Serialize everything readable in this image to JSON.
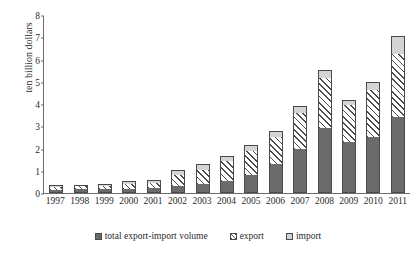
{
  "chart_data": {
    "type": "bar",
    "title": "",
    "subtitle": "",
    "xlabel": "",
    "ylabel": "ten billion dollars",
    "ylim": [
      0,
      8
    ],
    "ytick_values": [
      0,
      1,
      2,
      3,
      4,
      5,
      6,
      7,
      8
    ],
    "ytick_labels": [
      "0",
      "1",
      "2",
      "3",
      "4",
      "5",
      "6",
      "7",
      "8"
    ],
    "grid": false,
    "stacked": true,
    "legend_position": "bottom",
    "categories": [
      "1997",
      "1998",
      "1999",
      "2000",
      "2001",
      "2002",
      "2003",
      "2004",
      "2005",
      "2006",
      "2007",
      "2008",
      "2009",
      "2010",
      "2011"
    ],
    "series": [
      {
        "name": "total export-import volume",
        "color": "#6b6b6b",
        "pattern": "solid",
        "values": [
          0.15,
          0.16,
          0.17,
          0.2,
          0.22,
          0.3,
          0.4,
          0.55,
          0.8,
          1.3,
          2.0,
          2.9,
          2.3,
          2.5,
          3.4
        ]
      },
      {
        "name": "export",
        "color": "#ffffff",
        "pattern": "diagonal-hatch",
        "values": [
          0.13,
          0.14,
          0.15,
          0.22,
          0.24,
          0.5,
          0.65,
          0.9,
          1.1,
          1.2,
          1.6,
          2.25,
          1.65,
          2.15,
          2.85
        ]
      },
      {
        "name": "import",
        "color": "#d4d4d4",
        "pattern": "solid",
        "values": [
          0.07,
          0.07,
          0.08,
          0.13,
          0.14,
          0.25,
          0.25,
          0.2,
          0.25,
          0.3,
          0.3,
          0.4,
          0.25,
          0.35,
          0.8
        ]
      }
    ],
    "totals": [
      0.35,
      0.37,
      0.4,
      0.55,
      0.6,
      1.05,
      1.3,
      1.65,
      2.15,
      2.8,
      3.9,
      5.55,
      4.2,
      5.0,
      7.05
    ]
  },
  "legend": {
    "items": [
      {
        "label": "total export-import volume",
        "swatch": "square-dark-icon"
      },
      {
        "label": "export",
        "swatch": "square-hatched-icon"
      },
      {
        "label": "import",
        "swatch": "square-light-icon"
      }
    ]
  }
}
